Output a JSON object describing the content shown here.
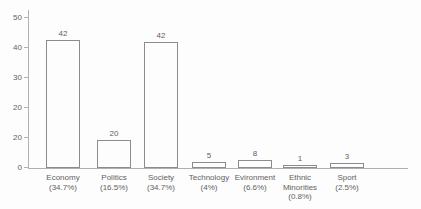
{
  "colors": {
    "background": "#fdfdfd",
    "axis": "#b0b0b0",
    "bar_border": "#8c8c8c",
    "bar_fill": "#fdfdfd",
    "text": "#5f5f5f"
  },
  "chart_data": {
    "type": "bar",
    "title": "",
    "xlabel": "",
    "ylabel": "",
    "grid": false,
    "legend": false,
    "y_axis": {
      "tick_labels_top_to_bottom": [
        "50",
        "40",
        "30",
        "20",
        "20",
        "0"
      ],
      "axis_min": 0,
      "axis_max": 50
    },
    "categories": [
      "Economy",
      "Politics",
      "Society",
      "Technology",
      "Evironment",
      "Ethnic Minorities",
      "Sport"
    ],
    "values": [
      42,
      20,
      42,
      5,
      8,
      1,
      3
    ],
    "percent_labels": [
      "(34.7%)",
      "(16.5%)",
      "(34.7%)",
      "(4%)",
      "(6.6%)",
      "(0.8%)",
      "(2.5%)"
    ],
    "bars": [
      {
        "category": "Economy",
        "value": 42,
        "value_label": "42",
        "percent": "34.7%",
        "label_lines": [
          "Economy",
          "(34.7%)"
        ],
        "height_px": 128
      },
      {
        "category": "Politics",
        "value": 20,
        "value_label": "20",
        "percent": "16.5%",
        "label_lines": [
          "Politics",
          "(16.5%)"
        ],
        "height_px": 28
      },
      {
        "category": "Society",
        "value": 42,
        "value_label": "42",
        "percent": "34.7%",
        "label_lines": [
          "Society",
          "(34.7%)"
        ],
        "height_px": 126
      },
      {
        "category": "Technology",
        "value": 5,
        "value_label": "5",
        "percent": "4%",
        "label_lines": [
          "Technology",
          "(4%)"
        ],
        "height_px": 6
      },
      {
        "category": "Evironment",
        "value": 8,
        "value_label": "8",
        "percent": "6.6%",
        "label_lines": [
          "Evironment",
          "(6.6%)"
        ],
        "height_px": 8
      },
      {
        "category": "Ethnic Minorities",
        "value": 1,
        "value_label": "1",
        "percent": "0.8%",
        "label_lines": [
          "Ethnic",
          "Minorities",
          "(0.8%)"
        ],
        "height_px": 3
      },
      {
        "category": "Sport",
        "value": 3,
        "value_label": "3",
        "percent": "2.5%",
        "label_lines": [
          "Sport",
          "(2.5%)"
        ],
        "height_px": 5
      }
    ]
  }
}
